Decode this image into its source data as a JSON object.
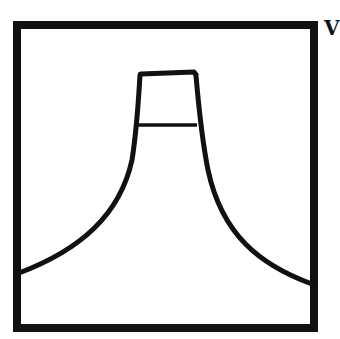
{
  "figure": {
    "colors": {
      "stroke": "#111111",
      "background": "#ffffff"
    },
    "frame": {
      "x": 17,
      "y": 25,
      "width": 297,
      "height": 303,
      "stroke_width": 8
    },
    "shape": {
      "top_cap": {
        "left_top": [
          139,
          74
        ],
        "right_top": [
          194,
          72
        ]
      },
      "neck_line_y": 125,
      "left_base": [
        17,
        273
      ],
      "right_base": [
        314,
        284
      ],
      "stroke_width": 5
    },
    "edge_glyph": "V"
  }
}
